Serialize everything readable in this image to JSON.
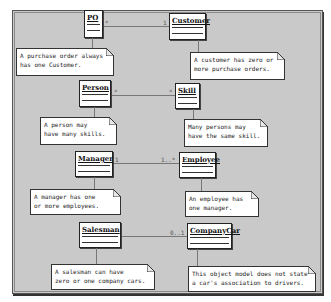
{
  "diagram": {
    "type": "UML class diagram",
    "colors": {
      "panel_bg": "#c9c9c9",
      "box_bg": "#ffffff",
      "line": "#777777"
    },
    "classes": [
      {
        "id": "po",
        "name": "PO"
      },
      {
        "id": "customer",
        "name": "Customer"
      },
      {
        "id": "person",
        "name": "Person"
      },
      {
        "id": "skill",
        "name": "Skill"
      },
      {
        "id": "manager",
        "name": "Manager"
      },
      {
        "id": "employee",
        "name": "Employee"
      },
      {
        "id": "salesman",
        "name": "Salesman"
      },
      {
        "id": "companycar",
        "name": "CompanyCar"
      }
    ],
    "associations": [
      {
        "from": "PO",
        "to": "Customer",
        "from_mult": "*",
        "to_mult": "1"
      },
      {
        "from": "Person",
        "to": "Skill",
        "from_mult": "*",
        "to_mult": "*"
      },
      {
        "from": "Manager",
        "to": "Employee",
        "from_mult": "1",
        "to_mult": "1..*"
      },
      {
        "from": "Salesman",
        "to": "CompanyCar",
        "from_mult": "",
        "to_mult": "0..1"
      }
    ],
    "notes": [
      {
        "line1": "A purchase order always",
        "line2": "has one Customer."
      },
      {
        "line1": "A customer has zero or",
        "line2": "more purchase orders."
      },
      {
        "line1": "A person may",
        "line2": "have many skills."
      },
      {
        "line1": "Many persons may",
        "line2": "have the same skill."
      },
      {
        "line1": "A manager has one",
        "line2": "or more employees."
      },
      {
        "line1": "An employee has",
        "line2": "one manager."
      },
      {
        "line1": "A salesman can have",
        "line2": "zero or one company cars."
      },
      {
        "line1": "This object model does not state",
        "line2": "a car's association to drivers."
      }
    ]
  }
}
